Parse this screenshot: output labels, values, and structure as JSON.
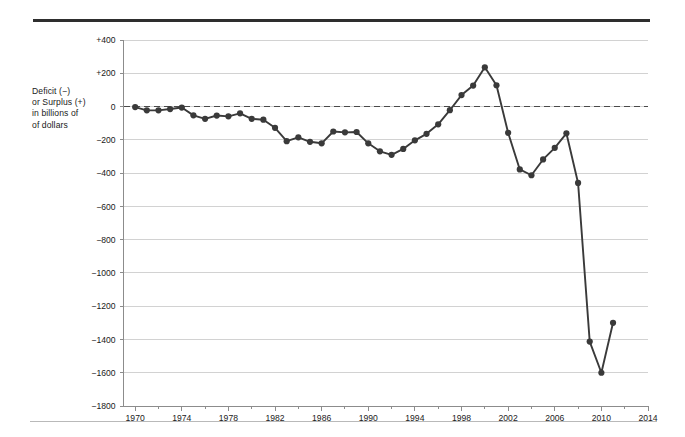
{
  "figure": {
    "axis_label_lines": [
      "Deficit (−)",
      "or Surplus (+)",
      "in billions of",
      "of dollars"
    ],
    "line_color": "#3a3a3a",
    "marker_color": "#3a3a3a",
    "grid_color": "#d2d2d2",
    "axis_color": "#8c8c8c",
    "zero_line_color": "#4a4a4a",
    "top_rule_color": "#2e2e2e",
    "bottom_rule_color": "#b9b9b9"
  },
  "chart_data": {
    "type": "line",
    "title": "",
    "subtitle": "",
    "xlabel": "",
    "ylabel": "Deficit (−) or Surplus (+) in billions of of dollars",
    "xlim": [
      1969,
      2014
    ],
    "ylim": [
      -1800,
      400
    ],
    "grid": true,
    "legend": "none",
    "zero_reference_line": 0,
    "y_ticks": [
      400,
      200,
      0,
      -200,
      -400,
      -600,
      -800,
      -1000,
      -1200,
      -1400,
      -1600,
      -1800
    ],
    "y_tick_labels": [
      "+400",
      "+200",
      "0",
      "−200",
      "−400",
      "−600",
      "−800",
      "−1000",
      "−1200",
      "−1400",
      "−1600",
      "−1800"
    ],
    "x_ticks": [
      1970,
      1974,
      1978,
      1982,
      1986,
      1990,
      1994,
      1998,
      2002,
      2006,
      2010,
      2014
    ],
    "x_tick_labels": [
      "1970",
      "1974",
      "1978",
      "1982",
      "1986",
      "1990",
      "1994",
      "1998",
      "2002",
      "2006",
      "2010",
      "2014"
    ],
    "x_minor_ticks": [
      1972,
      1976,
      1980,
      1984,
      1988,
      1992,
      1996,
      2000,
      2004,
      2008,
      2012
    ],
    "x": [
      1970,
      1971,
      1972,
      1973,
      1974,
      1975,
      1976,
      1977,
      1978,
      1979,
      1980,
      1981,
      1982,
      1983,
      1984,
      1985,
      1986,
      1987,
      1988,
      1989,
      1990,
      1991,
      1992,
      1993,
      1994,
      1995,
      1996,
      1997,
      1998,
      1999,
      2000,
      2001,
      2002,
      2003,
      2004,
      2005,
      2006,
      2007,
      2008,
      2009,
      2010,
      2011
    ],
    "values": [
      -3,
      -23,
      -23,
      -15,
      -6,
      -53,
      -74,
      -54,
      -59,
      -41,
      -74,
      -79,
      -128,
      -208,
      -185,
      -212,
      -221,
      -150,
      -155,
      -153,
      -221,
      -269,
      -290,
      -255,
      -203,
      -164,
      -107,
      -22,
      69,
      126,
      236,
      128,
      -158,
      -378,
      -413,
      -318,
      -248,
      -161,
      -459,
      -1413,
      -1600,
      -1300
    ],
    "series": [
      {
        "name": "Federal budget deficit or surplus",
        "values": [
          -3,
          -23,
          -23,
          -15,
          -6,
          -53,
          -74,
          -54,
          -59,
          -41,
          -74,
          -79,
          -128,
          -208,
          -185,
          -212,
          -221,
          -150,
          -155,
          -153,
          -221,
          -269,
          -290,
          -255,
          -203,
          -164,
          -107,
          -22,
          69,
          126,
          236,
          128,
          -158,
          -378,
          -413,
          -318,
          -248,
          -161,
          -459,
          -1413,
          -1600,
          -1300
        ]
      }
    ]
  }
}
